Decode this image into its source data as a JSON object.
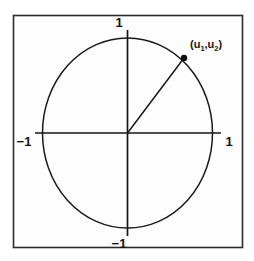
{
  "figure": {
    "frame": {
      "stroke_color": "#2b2b2b",
      "fill_color": "#fdfdfd",
      "x": 13,
      "y": 15,
      "width": 230,
      "height": 233
    },
    "colors": {
      "ink": "#141414",
      "curve": "#1a1a1a",
      "axis": "#141414",
      "background": "#ffffff",
      "panel": "#fdfdfd"
    },
    "circle": {
      "name": "unit-circle",
      "center_x": 127.5,
      "center_y": 133,
      "radius_x": 85,
      "radius_y": 95,
      "stroke_width": 1.5
    },
    "axes": {
      "x_axis": {
        "x1": 35,
        "y1": 133,
        "x2": 221,
        "y2": 133
      },
      "y_axis": {
        "x1": 127.5,
        "y1": 30,
        "x2": 127.5,
        "y2": 236
      }
    },
    "radius_line": {
      "name": "radius-vector",
      "x1": 127.5,
      "y1": 133,
      "x2": 184,
      "y2": 58
    },
    "point": {
      "name": "unit-vector-point",
      "x": 184,
      "y": 58,
      "radius": 3.2,
      "label_text": "(u",
      "label_sub1": "1",
      "label_mid": ",u",
      "label_sub2": "2",
      "label_end": ")",
      "label_x": 190,
      "label_y": 48
    },
    "tick_labels": [
      {
        "name": "tick-label-top",
        "text": "1",
        "x": 119,
        "y": 27,
        "anchor": "middle"
      },
      {
        "name": "tick-label-right",
        "text": "1",
        "x": 229,
        "y": 146,
        "anchor": "middle"
      },
      {
        "name": "tick-label-left",
        "text": "−1",
        "x": 24,
        "y": 146,
        "anchor": "middle"
      },
      {
        "name": "tick-label-bottom",
        "text": "−1",
        "x": 119,
        "y": 248,
        "anchor": "middle"
      }
    ]
  }
}
